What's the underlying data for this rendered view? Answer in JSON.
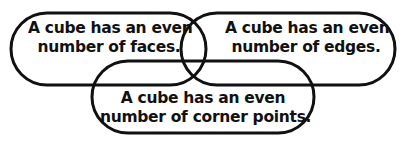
{
  "diagram": {
    "type": "venn",
    "stroke_color": "#111111",
    "background": "#ffffff",
    "sets": [
      {
        "id": "faces",
        "line1": "A cube has an even",
        "line2": "number of faces."
      },
      {
        "id": "edges",
        "line1": "A cube has an even",
        "line2": "number of edges."
      },
      {
        "id": "corners",
        "line1": "A cube has an even",
        "line2": "number of corner points."
      }
    ]
  }
}
